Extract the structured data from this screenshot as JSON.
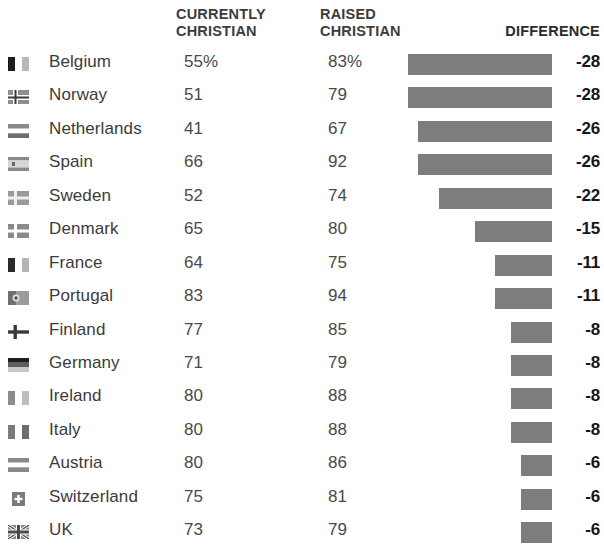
{
  "header": {
    "col_country": "",
    "col_currently": "CURRENTLY\nCHRISTIAN",
    "col_raised": "RAISED\nCHRISTIAN",
    "col_difference": "DIFFERENCE"
  },
  "style": {
    "bar_color": "#7d7d7d",
    "text_color": "#3b3b3b",
    "header_color": "#3c3c3c",
    "diff_color": "#161616",
    "background": "#ffffff"
  },
  "chart_data": {
    "type": "bar",
    "title": "",
    "xlabel": "",
    "ylabel": "",
    "grid": false,
    "legend": "none",
    "bar_axis": {
      "right_edge_px": 552,
      "px_per_unit": 5.14,
      "direction": "right-aligned, length proportional to |difference|"
    },
    "columns": [
      "Country",
      "CURRENTLY CHRISTIAN",
      "RAISED CHRISTIAN",
      "DIFFERENCE"
    ],
    "categories": [
      "Belgium",
      "Norway",
      "Netherlands",
      "Spain",
      "Sweden",
      "Denmark",
      "France",
      "Portugal",
      "Finland",
      "Germany",
      "Ireland",
      "Italy",
      "Austria",
      "Switzerland",
      "UK"
    ],
    "series": [
      {
        "name": "CURRENTLY CHRISTIAN",
        "values": [
          55,
          51,
          41,
          66,
          52,
          65,
          64,
          83,
          77,
          71,
          80,
          80,
          80,
          75,
          73
        ]
      },
      {
        "name": "RAISED CHRISTIAN",
        "values": [
          83,
          79,
          67,
          92,
          74,
          80,
          75,
          94,
          85,
          79,
          88,
          88,
          86,
          81,
          79
        ]
      },
      {
        "name": "DIFFERENCE",
        "values": [
          -28,
          -28,
          -26,
          -26,
          -22,
          -15,
          -11,
          -11,
          -8,
          -8,
          -8,
          -8,
          -6,
          -6,
          -6
        ]
      }
    ]
  },
  "rows": [
    {
      "flag": "flag-belgium-icon",
      "country": "Belgium",
      "currently": "55%",
      "raised": "83%",
      "difference": "-28",
      "diff_value": 28
    },
    {
      "flag": "flag-norway-icon",
      "country": "Norway",
      "currently": "51",
      "raised": "79",
      "difference": "-28",
      "diff_value": 28
    },
    {
      "flag": "flag-netherlands-icon",
      "country": "Netherlands",
      "currently": "41",
      "raised": "67",
      "difference": "-26",
      "diff_value": 26
    },
    {
      "flag": "flag-spain-icon",
      "country": "Spain",
      "currently": "66",
      "raised": "92",
      "difference": "-26",
      "diff_value": 26
    },
    {
      "flag": "flag-sweden-icon",
      "country": "Sweden",
      "currently": "52",
      "raised": "74",
      "difference": "-22",
      "diff_value": 22
    },
    {
      "flag": "flag-denmark-icon",
      "country": "Denmark",
      "currently": "65",
      "raised": "80",
      "difference": "-15",
      "diff_value": 15
    },
    {
      "flag": "flag-france-icon",
      "country": "France",
      "currently": "64",
      "raised": "75",
      "difference": "-11",
      "diff_value": 11
    },
    {
      "flag": "flag-portugal-icon",
      "country": "Portugal",
      "currently": "83",
      "raised": "94",
      "difference": "-11",
      "diff_value": 11
    },
    {
      "flag": "flag-finland-icon",
      "country": "Finland",
      "currently": "77",
      "raised": "85",
      "difference": "-8",
      "diff_value": 8
    },
    {
      "flag": "flag-germany-icon",
      "country": "Germany",
      "currently": "71",
      "raised": "79",
      "difference": "-8",
      "diff_value": 8
    },
    {
      "flag": "flag-ireland-icon",
      "country": "Ireland",
      "currently": "80",
      "raised": "88",
      "difference": "-8",
      "diff_value": 8
    },
    {
      "flag": "flag-italy-icon",
      "country": "Italy",
      "currently": "80",
      "raised": "88",
      "difference": "-8",
      "diff_value": 8
    },
    {
      "flag": "flag-austria-icon",
      "country": "Austria",
      "currently": "80",
      "raised": "86",
      "difference": "-6",
      "diff_value": 6
    },
    {
      "flag": "flag-switzerland-icon",
      "country": "Switzerland",
      "currently": "75",
      "raised": "81",
      "difference": "-6",
      "diff_value": 6
    },
    {
      "flag": "flag-uk-icon",
      "country": "UK",
      "currently": "73",
      "raised": "79",
      "difference": "-6",
      "diff_value": 6
    }
  ]
}
